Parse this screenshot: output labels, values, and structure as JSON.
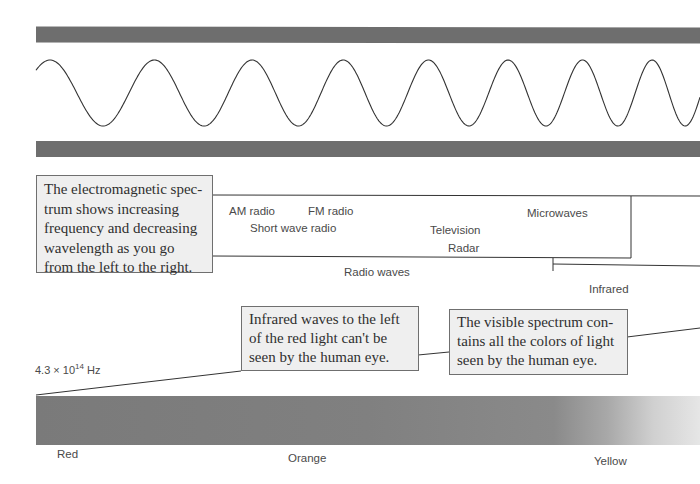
{
  "diagram": {
    "colors": {
      "band": "#6e6e6e",
      "wave": "#333333",
      "callout_bg": "#efefef",
      "callout_border": "#6f6f6f",
      "spectrum_dark": "#7a7a7a",
      "spectrum_light": "#e4e4e4"
    },
    "callouts": {
      "spectrum_intro": "The electromagnetic spectrum shows increasing frequency and decreasing wavelength as you go from the left to the right.",
      "spectrum_intro_lines": [
        "The electromagnetic spec-",
        "trum shows increasing",
        "frequency and decreasing",
        "wavelength as you go",
        "from the left to the right."
      ],
      "infrared_lines": [
        "Infrared waves to the left",
        "of the red light can't be",
        "seen by the human eye."
      ],
      "visible_lines": [
        "The visible spectrum con-",
        "tains all the colors of light",
        "seen by the human eye."
      ]
    },
    "radio_labels": {
      "am": "AM radio",
      "fm": "FM radio",
      "short_wave": "Short wave radio",
      "television": "Television",
      "radar": "Radar",
      "microwaves": "Microwaves",
      "group": "Radio waves"
    },
    "infrared_label": "Infrared",
    "frequency_label": {
      "mantissa": "4.3 × 10",
      "exponent": "14",
      "unit": " Hz"
    },
    "color_labels": {
      "red": "Red",
      "orange": "Orange",
      "yellow": "Yellow"
    }
  }
}
